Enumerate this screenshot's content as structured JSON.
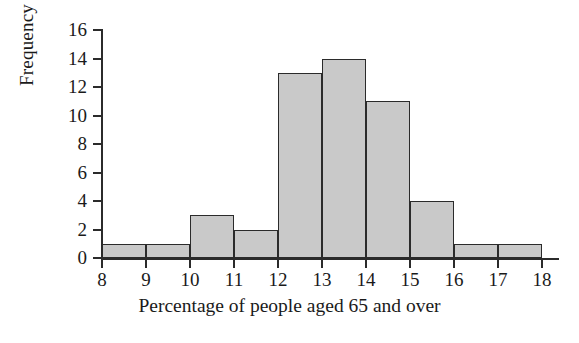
{
  "chart_data": {
    "type": "bar",
    "title": "",
    "xlabel": "Percentage of people aged 65 and over",
    "ylabel": "Frequency",
    "categories": [
      "8-9",
      "9-10",
      "10-11",
      "11-12",
      "12-13",
      "13-14",
      "14-15",
      "15-16",
      "16-17",
      "17-18"
    ],
    "bin_edges": [
      8,
      9,
      10,
      11,
      12,
      13,
      14,
      15,
      16,
      17,
      18
    ],
    "values": [
      1,
      1,
      3,
      2,
      13,
      14,
      11,
      4,
      1,
      1
    ],
    "xlim": [
      8,
      18
    ],
    "ylim": [
      0,
      16
    ],
    "x_ticks": [
      8,
      9,
      10,
      11,
      12,
      13,
      14,
      15,
      16,
      17,
      18
    ],
    "y_ticks": [
      0,
      2,
      4,
      6,
      8,
      10,
      12,
      14,
      16
    ],
    "grid": false,
    "legend": false,
    "bar_fill_color": "#c9c9c9",
    "bar_edge_color": "#2b2b2b",
    "axis_color": "#2b2b2b",
    "background_color": "#ffffff"
  }
}
